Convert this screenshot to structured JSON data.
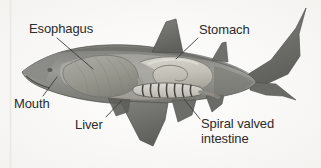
{
  "figure": {
    "kind": "anatomical-diagram",
    "background_color": "#fbfbfa",
    "text_color": "#2b2b2b",
    "leader_line_color": "#3c3c3c",
    "margin_rule_color": "#e6e6e6"
  },
  "labels": {
    "esophagus": "Esophagus",
    "mouth": "Mouth",
    "liver": "Liver",
    "stomach": "Stomach",
    "spiral_valved_intestine_line1": "Spiral valved",
    "spiral_valved_intestine_line2": "intestine"
  },
  "illustration": {
    "body_fill": "#8f8f8c",
    "body_shadow": "#6d6d6a",
    "body_highlight": "#a9a9a5",
    "fin_fill": "#7a7a77",
    "fin_dark": "#636360",
    "liver_fill": "#a0a09a",
    "liver_shade": "#8a8a84",
    "stomach_fill": "#c9c7bf",
    "stomach_shade": "#aeaca4",
    "intestine_fill": "#d6d4cc",
    "intestine_band": "#3a3a38",
    "outline": "#4a4a47"
  }
}
